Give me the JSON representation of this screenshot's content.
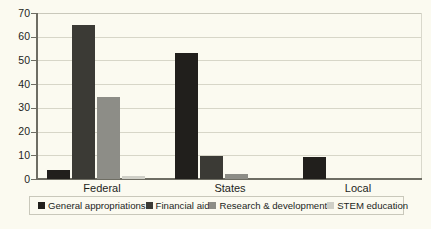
{
  "chart_data": {
    "type": "bar",
    "title": "",
    "xlabel": "",
    "ylabel": "",
    "ylim": [
      0,
      70
    ],
    "ytick_step": 10,
    "yticks": [
      "70",
      "60",
      "50",
      "40",
      "30",
      "20",
      "10",
      "0"
    ],
    "grid": true,
    "legend_position": "bottom",
    "categories": [
      "Federal",
      "States",
      "Local"
    ],
    "series": [
      {
        "name": "General appropriations",
        "color": "#211f1c",
        "values": [
          3.8,
          53.0,
          9.2
        ]
      },
      {
        "name": "Financial aid",
        "color": "#3b3a35",
        "values": [
          65.0,
          9.7,
          0.0
        ]
      },
      {
        "name": "Research & development",
        "color": "#8d8d87",
        "values": [
          34.5,
          2.2,
          0.0
        ]
      },
      {
        "name": "STEM education",
        "color": "#cfcfc7",
        "values": [
          1.2,
          0.0,
          0.0
        ]
      }
    ]
  },
  "legend": {
    "items": [
      {
        "label": "General appropriations",
        "color": "#211f1c"
      },
      {
        "label": "Financial aid",
        "color": "#3b3a35"
      },
      {
        "label": "Research & development",
        "color": "#8d8d87"
      },
      {
        "label": "STEM education",
        "color": "#cfcfc7"
      }
    ]
  },
  "colors": {
    "background": "#fbfaf0",
    "axis": "#6e6d63",
    "gridline": "#d7d6c8",
    "text": "#231f1c",
    "legend_border": "#c9c8bb"
  }
}
